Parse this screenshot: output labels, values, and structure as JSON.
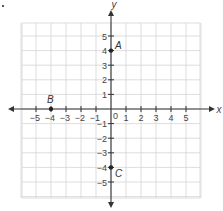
{
  "figure": {
    "marker": ".",
    "axes": {
      "x_label": "x",
      "y_label": "y",
      "x_ticks": [
        "-5",
        "-4",
        "-3",
        "-2",
        "-1",
        "1",
        "2",
        "3",
        "4",
        "5"
      ],
      "y_ticks": [
        "5",
        "4",
        "3",
        "2",
        "1",
        "-1",
        "-2",
        "-3",
        "-4",
        "-5"
      ],
      "origin_label": "0",
      "range": {
        "x": [
          -6,
          6
        ],
        "y": [
          -6,
          6
        ]
      }
    },
    "points": [
      {
        "label": "A",
        "x": 0,
        "y": 4
      },
      {
        "label": "B",
        "x": -4,
        "y": 0
      },
      {
        "label": "C",
        "x": 0,
        "y": -4
      }
    ],
    "colors": {
      "grid": "#d4d4d4",
      "axis": "#333333",
      "text": "#444444"
    }
  },
  "chart_data": {
    "type": "scatter",
    "title": "",
    "xlabel": "x",
    "ylabel": "y",
    "xlim": [
      -6,
      6
    ],
    "ylim": [
      -6,
      6
    ],
    "grid": true,
    "series": [
      {
        "name": "points",
        "x": [
          0,
          -4,
          0
        ],
        "y": [
          4,
          0,
          -4
        ],
        "labels": [
          "A",
          "B",
          "C"
        ]
      }
    ]
  }
}
